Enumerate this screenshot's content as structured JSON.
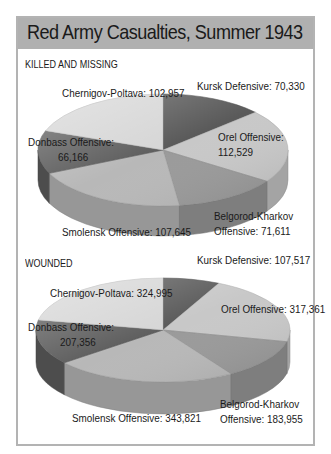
{
  "title": "Red Army Casualties, Summer 1943",
  "chart_data": [
    {
      "type": "pie",
      "title": "KILLED AND MISSING",
      "categories": [
        "Kursk Defensive",
        "Orel Offensive",
        "Belgorod-Kharkov Offensive",
        "Smolensk Offensive",
        "Donbass Offensive",
        "Chernigov-Poltava"
      ],
      "values": [
        70330,
        112529,
        71611,
        107645,
        66166,
        102957
      ],
      "labels": [
        [
          "Kursk Defensive: 70,330"
        ],
        [
          "Orel Offensive:",
          "112,529"
        ],
        [
          "Belgorod-Kharkov",
          "Offensive: 71,611"
        ],
        [
          "Smolensk Offensive: 107,645"
        ],
        [
          "Donbass Offensive:",
          "66,166"
        ],
        [
          "Chernigov-Poltava: 102,957"
        ]
      ],
      "colors": [
        "#5a5a5a",
        "#c8c8c8",
        "#9a9a9a",
        "#b8b8b8",
        "#5e5e5e",
        "#d6d6d6"
      ]
    },
    {
      "type": "pie",
      "title": "WOUNDED",
      "categories": [
        "Kursk Defensive",
        "Orel Offensive",
        "Belgorod-Kharkov Offensive",
        "Smolensk Offensive",
        "Donbass Offensive",
        "Chernigov-Poltava"
      ],
      "values": [
        107517,
        317361,
        183955,
        343821,
        207356,
        324995
      ],
      "labels": [
        [
          "Kursk Defensive: 107,517"
        ],
        [
          "Orel Offensive: 317,361"
        ],
        [
          "Belgorod-Kharkov",
          "Offensive: 183,955"
        ],
        [
          "Smolensk Offensive: 343,821"
        ],
        [
          "Donbass Offensive:",
          "207,356"
        ],
        [
          "Chernigov-Poltava: 324,995"
        ]
      ],
      "colors": [
        "#5a5a5a",
        "#c8c8c8",
        "#9a9a9a",
        "#b8b8b8",
        "#5e5e5e",
        "#d6d6d6"
      ]
    }
  ]
}
